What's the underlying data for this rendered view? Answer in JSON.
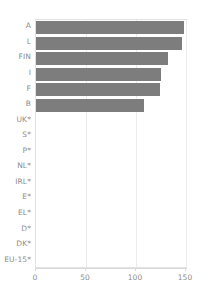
{
  "chart_data": {
    "type": "bar",
    "orientation": "horizontal",
    "title": "",
    "subtitle": "",
    "xlabel": "",
    "ylabel": "",
    "categories": [
      "A",
      "L",
      "FIN",
      "I",
      "F",
      "B",
      "UK*",
      "S*",
      "P*",
      "NL*",
      "IRL*",
      "E*",
      "EL*",
      "D*",
      "DK*",
      "EU-15*"
    ],
    "values": [
      148,
      146,
      132,
      125,
      124,
      108,
      0,
      0,
      0,
      0,
      0,
      0,
      0,
      0,
      0,
      0
    ],
    "series": [
      {
        "name": "",
        "values": [
          148,
          146,
          132,
          125,
          124,
          108,
          0,
          0,
          0,
          0,
          0,
          0,
          0,
          0,
          0,
          0
        ]
      }
    ],
    "xlim": [
      0,
      150
    ],
    "xticks": [
      0,
      50,
      100,
      150
    ],
    "xtick_labels": [
      "0",
      "50",
      "100",
      "150"
    ],
    "grid": "vertical",
    "legend": "none",
    "bar_color": "#7d7d7d",
    "text_color": "#8d8d8d",
    "gridline_color": "#ececec",
    "frame_color": "#e2e2e2",
    "annotations": []
  },
  "axis": {
    "ticks": [
      {
        "label": "0",
        "value": 0
      },
      {
        "label": "50",
        "value": 50
      },
      {
        "label": "100",
        "value": 100
      },
      {
        "label": "150",
        "value": 150
      }
    ]
  },
  "rows": [
    {
      "label": "A",
      "value": 148
    },
    {
      "label": "L",
      "value": 146
    },
    {
      "label": "FIN",
      "value": 132
    },
    {
      "label": "I",
      "value": 125
    },
    {
      "label": "F",
      "value": 124
    },
    {
      "label": "B",
      "value": 108
    },
    {
      "label": "UK*",
      "value": 0
    },
    {
      "label": "S*",
      "value": 0
    },
    {
      "label": "P*",
      "value": 0
    },
    {
      "label": "NL*",
      "value": 0
    },
    {
      "label": "IRL*",
      "value": 0
    },
    {
      "label": "E*",
      "value": 0
    },
    {
      "label": "EL*",
      "value": 0
    },
    {
      "label": "D*",
      "value": 0
    },
    {
      "label": "DK*",
      "value": 0
    },
    {
      "label": "EU-15*",
      "value": 0
    }
  ]
}
